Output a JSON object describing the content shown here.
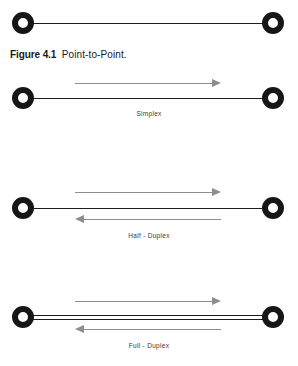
{
  "figure": {
    "caption_label": "Figure 4.1",
    "caption_text": "Point-to-Point."
  },
  "diagrams": [
    {
      "id": "point-to-point",
      "label": "",
      "lines": 1,
      "arrows": []
    },
    {
      "id": "simplex",
      "label": "Simplex",
      "lines": 1,
      "arrows": [
        "right"
      ]
    },
    {
      "id": "half-duplex",
      "label": "Half - Duplex",
      "lines": 1,
      "arrows": [
        "right",
        "left"
      ]
    },
    {
      "id": "full-duplex",
      "label": "Full - Duplex",
      "lines": 2,
      "arrows": [
        "right",
        "left"
      ]
    }
  ],
  "colors": {
    "node_ring": "#161616",
    "node_fill": "#ffffff",
    "connector": "#1d1d1d",
    "arrow": "#8d8d8d",
    "label_text": "#3a3a3a",
    "caption_text": "#1a1a1a",
    "background": "#ffffff"
  }
}
